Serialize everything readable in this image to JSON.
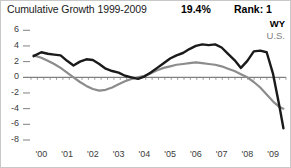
{
  "header": {
    "title": "Cumulative Growth 1999-2009",
    "growth_value": "19.4%",
    "rank_label": "Rank: 1"
  },
  "legend": {
    "series_primary": "WY",
    "series_secondary": "U.S."
  },
  "colors": {
    "primary_line": "#1a1a1a",
    "secondary_line": "#8c8c8c",
    "axis": "#808080",
    "text": "#1a1a1a",
    "border": "#c8c8c8"
  },
  "chart_data": {
    "type": "line",
    "title": "Cumulative Growth 1999-2009",
    "xlabel": "",
    "ylabel": "",
    "xlim": [
      1999.6,
      2009.5
    ],
    "ylim": [
      -8,
      6.8
    ],
    "yticks": [
      6,
      4,
      2,
      0,
      -2,
      -4,
      -6,
      -8
    ],
    "ytick_labels": [
      "6",
      "4",
      "2",
      "0",
      "-2",
      "-4",
      "-6",
      "-8"
    ],
    "xticks": [
      2000,
      2001,
      2002,
      2003,
      2004,
      2005,
      2006,
      2007,
      2008,
      2009
    ],
    "xtick_labels": [
      "'00",
      "'01",
      "'02",
      "'03",
      "'04",
      "'05",
      "'06",
      "'07",
      "'08",
      "'09"
    ],
    "grid": false,
    "zero_line": true,
    "legend_position": "top-right",
    "series": [
      {
        "name": "WY",
        "color": "#1a1a1a",
        "x": [
          1999.7,
          2000.0,
          2000.25,
          2000.5,
          2000.75,
          2001.0,
          2001.25,
          2001.5,
          2001.75,
          2002.0,
          2002.25,
          2002.5,
          2002.75,
          2003.0,
          2003.25,
          2003.5,
          2003.75,
          2004.0,
          2004.25,
          2004.5,
          2004.75,
          2005.0,
          2005.25,
          2005.5,
          2005.75,
          2006.0,
          2006.25,
          2006.5,
          2006.75,
          2007.0,
          2007.25,
          2007.5,
          2007.75,
          2008.0,
          2008.25,
          2008.5,
          2008.75,
          2009.0,
          2009.25,
          2009.4
        ],
        "values": [
          2.7,
          3.2,
          3.0,
          2.9,
          2.8,
          2.1,
          1.5,
          2.0,
          2.3,
          2.2,
          1.7,
          1.1,
          0.8,
          0.6,
          0.2,
          0.0,
          -0.2,
          0.1,
          0.6,
          1.2,
          1.8,
          2.4,
          2.8,
          3.1,
          3.6,
          4.0,
          4.2,
          4.1,
          4.2,
          3.8,
          3.0,
          2.2,
          1.2,
          2.1,
          3.3,
          3.4,
          3.2,
          0.4,
          -3.8,
          -6.5
        ]
      },
      {
        "name": "U.S.",
        "color": "#8c8c8c",
        "x": [
          1999.7,
          2000.0,
          2000.25,
          2000.5,
          2000.75,
          2001.0,
          2001.25,
          2001.5,
          2001.75,
          2002.0,
          2002.25,
          2002.5,
          2002.75,
          2003.0,
          2003.25,
          2003.5,
          2003.75,
          2004.0,
          2004.25,
          2004.5,
          2004.75,
          2005.0,
          2005.25,
          2005.5,
          2005.75,
          2006.0,
          2006.25,
          2006.5,
          2006.75,
          2007.0,
          2007.25,
          2007.5,
          2007.75,
          2008.0,
          2008.25,
          2008.5,
          2008.75,
          2009.0,
          2009.25,
          2009.4
        ],
        "values": [
          2.8,
          2.5,
          2.1,
          1.7,
          1.2,
          0.6,
          0.0,
          -0.6,
          -1.1,
          -1.5,
          -1.7,
          -1.6,
          -1.3,
          -0.9,
          -0.5,
          -0.2,
          0.0,
          0.2,
          0.5,
          0.9,
          1.2,
          1.4,
          1.6,
          1.7,
          1.8,
          1.9,
          1.8,
          1.7,
          1.6,
          1.4,
          1.1,
          0.8,
          0.4,
          0.0,
          -0.6,
          -1.3,
          -2.2,
          -3.1,
          -3.8,
          -4.0
        ]
      }
    ]
  }
}
